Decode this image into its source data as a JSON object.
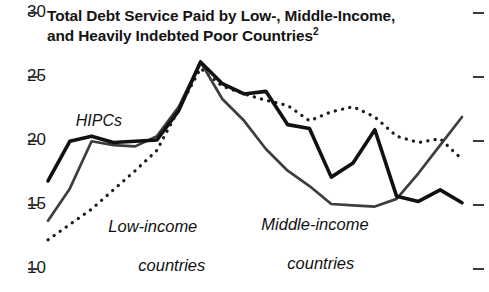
{
  "chart_data": {
    "type": "line",
    "title": "Total Debt Service Paid by Low-, Middle-Income, and Heavily Indebted Poor Countries",
    "title_line1": "Total Debt Service Paid by Low-, Middle-Income,",
    "title_line2": "and Heavily Indebted Poor Countries",
    "title_superscript": "2",
    "xlabel": "",
    "ylabel": "",
    "ylim": [
      10,
      30
    ],
    "ytick_labels": [
      "30",
      "25",
      "20",
      "15",
      "10"
    ],
    "ytick_values": [
      30,
      25,
      20,
      15,
      10
    ],
    "grid": false,
    "legend": "inline-annotations",
    "x": [
      1,
      2,
      3,
      4,
      5,
      6,
      7,
      8,
      9,
      10,
      11,
      12,
      13,
      14,
      15,
      16,
      17,
      18,
      19,
      20
    ],
    "series": [
      {
        "name": "HIPCs",
        "style": "solid-thick",
        "color": "#111111",
        "values": [
          16.8,
          19.9,
          20.3,
          19.8,
          19.9,
          20.0,
          22.3,
          26.1,
          24.4,
          23.6,
          23.8,
          21.2,
          20.9,
          17.1,
          18.2,
          20.8,
          15.6,
          15.2,
          16.1,
          15.1
        ]
      },
      {
        "name": "Middle-income countries",
        "style": "solid-medium",
        "color": "#3d3d3d",
        "values": [
          13.7,
          16.2,
          19.9,
          19.6,
          19.5,
          20.3,
          22.6,
          26.1,
          23.2,
          21.5,
          19.3,
          17.6,
          16.4,
          15.0,
          14.9,
          14.8,
          15.4,
          17.4,
          19.6,
          21.8
        ]
      },
      {
        "name": "Low-income countries",
        "style": "dotted",
        "color": "#1c1c1c",
        "values": [
          12.2,
          13.4,
          14.6,
          16.1,
          17.6,
          19.2,
          22.4,
          25.6,
          24.2,
          23.6,
          23.1,
          22.7,
          21.5,
          22.2,
          22.6,
          21.8,
          20.3,
          19.8,
          20.1,
          18.5
        ]
      }
    ],
    "annotations": [
      {
        "text": "HIPCs",
        "series": "HIPCs"
      },
      {
        "text": "Low-income\ncountries",
        "series": "Low-income countries"
      },
      {
        "text": "Middle-income\ncountries",
        "series": "Middle-income countries"
      }
    ]
  },
  "labels": {
    "hipcs": "HIPCs",
    "low_line1": "Low-income",
    "low_line2": "countries",
    "mid_line1": "Middle-income",
    "mid_line2": "countries"
  }
}
